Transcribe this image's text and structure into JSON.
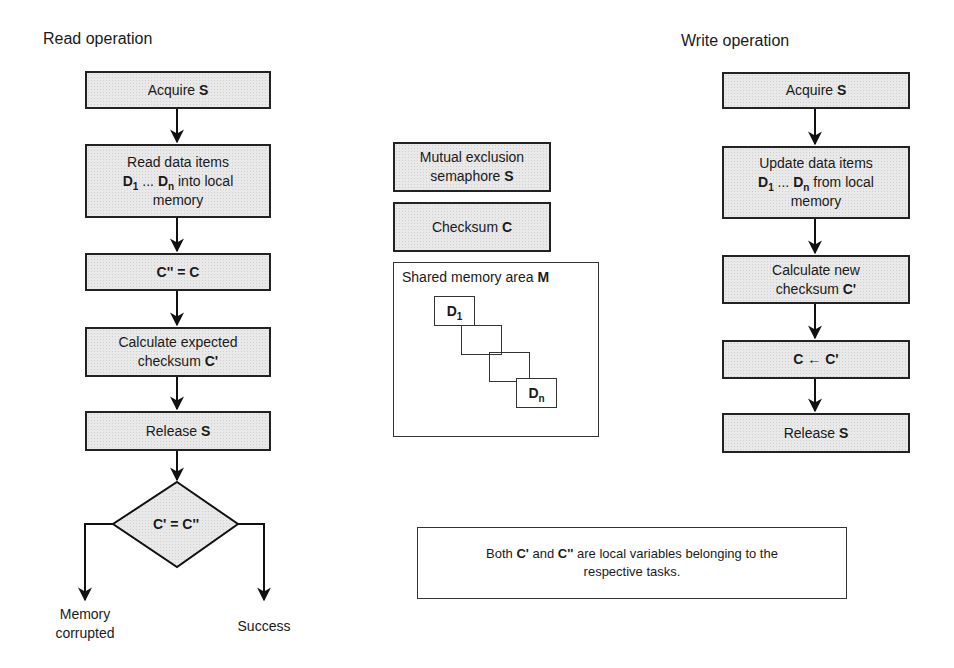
{
  "read_operation": {
    "title": "Read operation",
    "steps": [
      {
        "text": "Acquire",
        "bold": "S"
      },
      {
        "line1": "Read data items",
        "d1": "D",
        "sub1": "1",
        "dots": " ... ",
        "dn": "D",
        "subn": "n",
        "rest": " into local",
        "line3": "memory"
      },
      {
        "bold": "C'' = C"
      },
      {
        "line1": "Calculate expected",
        "line2": "checksum",
        "bold": "C'"
      },
      {
        "text": "Release",
        "bold": "S"
      }
    ],
    "decision": {
      "label": "C' = C''"
    },
    "outcomes": {
      "left": {
        "line1": "Memory",
        "line2": "corrupted"
      },
      "right": "Success"
    }
  },
  "shared": {
    "mutex": {
      "line1": "Mutual exclusion",
      "line2": "semaphore",
      "bold": "S"
    },
    "checksum": {
      "text": "Checksum",
      "bold": "C"
    },
    "memory_area": {
      "text": "Shared memory area",
      "bold": "M",
      "first_item": "D",
      "first_sub": "1",
      "last_item": "D",
      "last_sub": "n"
    }
  },
  "write_operation": {
    "title": "Write operation",
    "steps": [
      {
        "text": "Acquire",
        "bold": "S"
      },
      {
        "line1": "Update data items",
        "d1": "D",
        "sub1": "1",
        "dots": " ... ",
        "dn": "D",
        "subn": "n",
        "rest": " from local",
        "line3": "memory"
      },
      {
        "line1": "Calculate new",
        "line2": "checksum",
        "bold": "C'"
      },
      {
        "bold": "C ← C'"
      },
      {
        "text": "Release",
        "bold": "S"
      }
    ]
  },
  "note": {
    "pre": "Both ",
    "c1": "C'",
    "mid": " and ",
    "c2": "C''",
    "post": " are local variables belonging to the",
    "line2": "respective tasks."
  }
}
